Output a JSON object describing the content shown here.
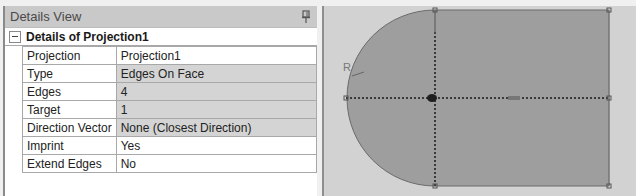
{
  "details_view": {
    "title": "Details View",
    "pin_icon": "pin-icon",
    "group": {
      "label": "Details of Projection1",
      "collapse_icon": "collapse-minus-icon",
      "properties": [
        {
          "name": "Projection",
          "value": "Projection1",
          "shaded": false
        },
        {
          "name": "Type",
          "value": "Edges On Face",
          "shaded": true
        },
        {
          "name": "Edges",
          "value": "4",
          "shaded": true
        },
        {
          "name": "Target",
          "value": "1",
          "shaded": true
        },
        {
          "name": "Direction Vector",
          "value": "None (Closest Direction)",
          "shaded": true
        },
        {
          "name": "Imprint",
          "value": "Yes",
          "shaded": false
        },
        {
          "name": "Extend Edges",
          "value": "No",
          "shaded": false
        }
      ]
    }
  },
  "viewport": {
    "radius_label": "R",
    "colors": {
      "background": "#d2d2d2",
      "face_fill": "#9e9e9e",
      "edge": "#6a6a6a",
      "construction_line": "#3a3a3a"
    }
  }
}
